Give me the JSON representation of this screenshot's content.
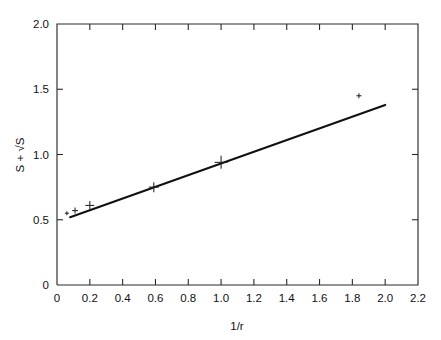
{
  "chart_data": {
    "type": "scatter",
    "title": "",
    "xlabel": "1/r",
    "ylabel": "S + √S",
    "xlim": [
      0,
      2.2
    ],
    "ylim": [
      0,
      2.0
    ],
    "grid": false,
    "legend": null,
    "xticks": [
      "0",
      "0.2",
      "0.4",
      "0.6",
      "0.8",
      "1.0",
      "1.2",
      "1.4",
      "1.6",
      "1.8",
      "2.0",
      "2.2"
    ],
    "xtick_values": [
      0,
      0.2,
      0.4,
      0.6,
      0.8,
      1.0,
      1.2,
      1.4,
      1.6,
      1.8,
      2.0,
      2.2
    ],
    "yticks": [
      "0",
      "0.5",
      "1.0",
      "1.5",
      "2.0"
    ],
    "ytick_values": [
      0,
      0.5,
      1.0,
      1.5,
      2.0
    ],
    "series": [
      {
        "name": "measurements",
        "marker": "plus",
        "x": [
          0.06,
          0.11,
          0.2,
          0.59,
          1.0,
          1.84
        ],
        "y": [
          0.55,
          0.57,
          0.61,
          0.75,
          0.94,
          1.45
        ],
        "marker_sizes": [
          4,
          6,
          9,
          10,
          13,
          5
        ]
      },
      {
        "name": "linear-fit",
        "type": "line",
        "x": [
          0.08,
          2.0
        ],
        "y": [
          0.52,
          1.38
        ]
      }
    ]
  },
  "axis": {
    "x_title": "1/r",
    "y_title": "S + √S"
  }
}
